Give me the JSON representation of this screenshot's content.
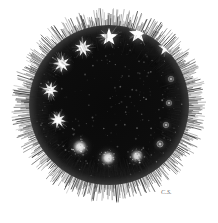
{
  "plate": {
    "title": "Telescopic field of stars",
    "description": "Antique engraving of a dark circular telescopic field filled with stars of several magnitudes, ringed by fine radiating hatch lines.",
    "background_color": "#ffffff",
    "disc_color": "#0b0b0b",
    "star_color": "#ffffff",
    "hatch_color": "#101010",
    "signature": "C.S.",
    "disc": {
      "center_x": 100,
      "center_y": 97,
      "radius": 80,
      "hatch_outer_radius": 96,
      "hatch_line_count": 620
    }
  },
  "field_objects": [
    {
      "id": "star-01",
      "label": "bright five-pointed star",
      "kind": "star5",
      "x": 100,
      "y": 29,
      "size": 15,
      "brightness": 1.0
    },
    {
      "id": "star-02",
      "label": "bright five-pointed star",
      "kind": "star5",
      "x": 129,
      "y": 26,
      "size": 15,
      "brightness": 1.0
    },
    {
      "id": "star-03",
      "label": "five-pointed star",
      "kind": "star5",
      "x": 157,
      "y": 40,
      "size": 13,
      "brightness": 0.96
    },
    {
      "id": "star-04",
      "label": "multi-point star burst",
      "kind": "burst8",
      "x": 74,
      "y": 40,
      "size": 14,
      "brightness": 0.95
    },
    {
      "id": "star-05",
      "label": "multi-point star burst",
      "kind": "burst8",
      "x": 53,
      "y": 56,
      "size": 14,
      "brightness": 0.95
    },
    {
      "id": "star-06",
      "label": "multi-point star burst",
      "kind": "burst8",
      "x": 41,
      "y": 82,
      "size": 13,
      "brightness": 0.92
    },
    {
      "id": "star-07",
      "label": "multi-point star burst",
      "kind": "burst8",
      "x": 49,
      "y": 112,
      "size": 13,
      "brightness": 0.92
    },
    {
      "id": "star-08",
      "label": "diffuse nebulous blob",
      "kind": "blob",
      "x": 71,
      "y": 139,
      "size": 15,
      "brightness": 0.88
    },
    {
      "id": "star-09",
      "label": "diffuse nebulous blob",
      "kind": "blob",
      "x": 99,
      "y": 150,
      "size": 15,
      "brightness": 0.88
    },
    {
      "id": "star-10",
      "label": "diffuse nebulous blob",
      "kind": "blob",
      "x": 128,
      "y": 148,
      "size": 13,
      "brightness": 0.82
    },
    {
      "id": "star-11",
      "label": "faint point with halo",
      "kind": "faint",
      "x": 151,
      "y": 136,
      "size": 9,
      "brightness": 0.62
    },
    {
      "id": "star-12",
      "label": "faint point with halo",
      "kind": "faint",
      "x": 157,
      "y": 117,
      "size": 8,
      "brightness": 0.55
    },
    {
      "id": "star-13",
      "label": "faint ringed point",
      "kind": "faint",
      "x": 160,
      "y": 95,
      "size": 8,
      "brightness": 0.5
    },
    {
      "id": "star-14",
      "label": "faint ringed point",
      "kind": "faint",
      "x": 162,
      "y": 71,
      "size": 8,
      "brightness": 0.48
    }
  ]
}
